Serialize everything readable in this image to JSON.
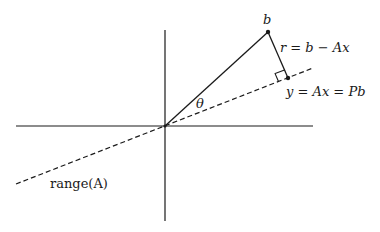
{
  "diagram": {
    "title": "",
    "colors": {
      "background": "#ffffff",
      "stroke": "#1a1a1a"
    },
    "origin": {
      "x": 165,
      "y": 126
    },
    "axes": {
      "horizontal": {
        "x1": 16,
        "y1": 126,
        "x2": 313,
        "y2": 126
      },
      "vertical": {
        "x1": 165,
        "y1": 30,
        "x2": 165,
        "y2": 221
      }
    },
    "range_line": {
      "x1": 16,
      "y1": 184,
      "x2": 313,
      "y2": 68,
      "style": "dashed"
    },
    "vector_b": {
      "x1": 165,
      "y1": 126,
      "x2": 268,
      "y2": 32
    },
    "residual": {
      "x1": 268,
      "y1": 32,
      "x2": 288,
      "y2": 78
    },
    "points": {
      "b": {
        "x": 268,
        "y": 32
      },
      "projection": {
        "x": 288,
        "y": 78
      }
    },
    "labels": {
      "b": "b",
      "residual": "r = b − Ax",
      "projection": "y = Ax = Pb",
      "theta": "θ",
      "range": "range(A)"
    }
  }
}
